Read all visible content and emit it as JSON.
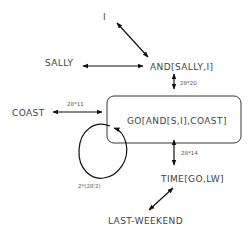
{
  "diagram": {
    "type": "semantic-network",
    "nodes": {
      "i": "I",
      "sally": "SALLY",
      "and": "AND[SALLY,I]",
      "coast": "COAST",
      "go": "GO[AND[S,I],COAST]",
      "time": "TIME[GO,LW]",
      "last_weekend": "LAST-WEEKEND"
    },
    "edges": {
      "i_and": "",
      "sally_and": "",
      "and_go": "28*20",
      "coast_go": "28*11",
      "go_self_loop": "2*(28'2)",
      "go_time": "28*14",
      "time_lastweekend": ""
    },
    "colors": {
      "line": "#111111",
      "text": "#444444",
      "background": "#ffffff"
    }
  }
}
